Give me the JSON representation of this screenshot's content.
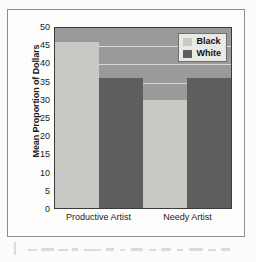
{
  "chart_data": {
    "type": "bar",
    "title": "",
    "xlabel": "",
    "ylabel": "Mean Proportion of Dollars",
    "ylim": [
      0,
      50
    ],
    "ytick_step": 5,
    "yticks": [
      50,
      45,
      40,
      35,
      30,
      25,
      20,
      15,
      10,
      5,
      0
    ],
    "grid": true,
    "legend_position": "top-right",
    "categories": [
      "Productive Artist",
      "Needy Artist"
    ],
    "series": [
      {
        "name": "Black",
        "color": "#c8c8c4",
        "values": [
          46,
          30
        ]
      },
      {
        "name": "White",
        "color": "#5e5e5e",
        "values": [
          36,
          36
        ]
      }
    ],
    "bars": [
      {
        "category": "Productive Artist",
        "series": "Black",
        "value": 46
      },
      {
        "category": "Productive Artist",
        "series": "White",
        "value": 36
      },
      {
        "category": "Needy Artist",
        "series": "Black",
        "value": 30
      },
      {
        "category": "Needy Artist",
        "series": "White",
        "value": 36
      }
    ]
  },
  "legend": {
    "entries": [
      {
        "label": "Black",
        "swatch": "series-black"
      },
      {
        "label": "White",
        "swatch": "series-white"
      }
    ]
  },
  "colors": {
    "plot_background": "#9a9a9a",
    "gridline": "#e4e4e2",
    "plot_border": "#3b3b3b",
    "series_black": "#c8c8c4",
    "series_white": "#5e5e5e",
    "page_background": "#fbfbfa"
  }
}
